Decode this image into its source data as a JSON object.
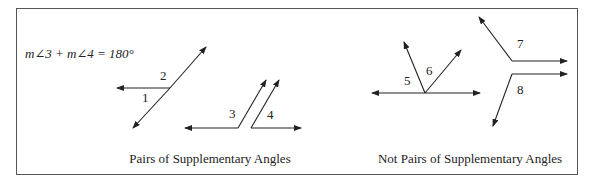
{
  "equation": "m∠3 + m∠4 = 180°",
  "left_panel": {
    "caption": "Pairs of Supplementary Angles",
    "angle_labels": [
      "1",
      "2",
      "3",
      "4"
    ]
  },
  "right_panel": {
    "caption": "Not Pairs of Supplementary Angles",
    "angle_labels": [
      "5",
      "6",
      "7",
      "8"
    ]
  },
  "colors": {
    "line": "#222222",
    "border": "#555555",
    "background": "#ffffff"
  }
}
